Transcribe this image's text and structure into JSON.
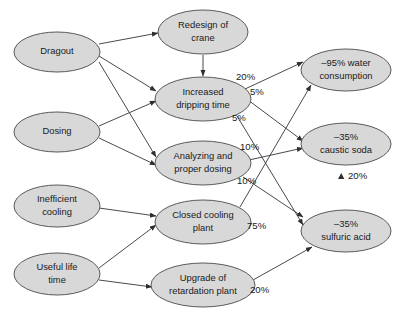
{
  "diagram": {
    "type": "influence-diagram",
    "background_color": "#ffffff",
    "node_fill": "#d8d8d8",
    "node_stroke": "#5a5a5a",
    "edge_color": "#4a4a4a",
    "text_color": "#1a1a1a",
    "nodes": [
      {
        "id": "dragout",
        "label_line1": "Dragout",
        "label_line2": "",
        "cx": 57,
        "cy": 52,
        "rx": 43,
        "ry": 20
      },
      {
        "id": "dosing",
        "label_line1": "Dosing",
        "label_line2": "",
        "cx": 57,
        "cy": 132,
        "rx": 43,
        "ry": 20
      },
      {
        "id": "inefficient",
        "label_line1": "Inefficient",
        "label_line2": "cooling",
        "cx": 57,
        "cy": 206,
        "rx": 43,
        "ry": 21
      },
      {
        "id": "usefullife",
        "label_line1": "Useful life",
        "label_line2": "time",
        "cx": 57,
        "cy": 274,
        "rx": 43,
        "ry": 21
      },
      {
        "id": "redesign",
        "label_line1": "Redesign of",
        "label_line2": "crane",
        "cx": 203,
        "cy": 32,
        "rx": 45,
        "ry": 22
      },
      {
        "id": "dripping",
        "label_line1": "Increased",
        "label_line2": "dripping time",
        "cx": 203,
        "cy": 99,
        "rx": 48,
        "ry": 22
      },
      {
        "id": "analyzing",
        "label_line1": "Analyzing and",
        "label_line2": "proper dosing",
        "cx": 203,
        "cy": 163,
        "rx": 48,
        "ry": 22
      },
      {
        "id": "closedcooling",
        "label_line1": "Closed cooling",
        "label_line2": "plant",
        "cx": 203,
        "cy": 222,
        "rx": 48,
        "ry": 22
      },
      {
        "id": "upgrade",
        "label_line1": "Upgrade of",
        "label_line2": "retardation plant",
        "cx": 203,
        "cy": 285,
        "rx": 52,
        "ry": 22
      },
      {
        "id": "water",
        "label_line1": "–95% water",
        "label_line2": "consumption",
        "cx": 346,
        "cy": 70,
        "rx": 45,
        "ry": 21
      },
      {
        "id": "caustic",
        "label_line1": "–35%",
        "label_line2": "caustic soda",
        "cx": 346,
        "cy": 144,
        "rx": 45,
        "ry": 21
      },
      {
        "id": "sulfuric",
        "label_line1": "–35%",
        "label_line2": "sulfuric acid",
        "cx": 346,
        "cy": 231,
        "rx": 45,
        "ry": 21
      }
    ],
    "edges": [
      {
        "id": "dragout-redesign",
        "from": "dragout",
        "to": "redesign",
        "label": "",
        "x1": 99,
        "y1": 44,
        "x2": 158,
        "y2": 33
      },
      {
        "id": "dragout-dripping",
        "from": "dragout",
        "to": "dripping",
        "label": "",
        "x1": 99,
        "y1": 56,
        "x2": 156,
        "y2": 91
      },
      {
        "id": "dragout-analyzing",
        "from": "dragout",
        "to": "analyzing",
        "label": "",
        "x1": 99,
        "y1": 62,
        "x2": 156,
        "y2": 157
      },
      {
        "id": "redesign-dripping",
        "from": "redesign",
        "to": "dripping",
        "label": "",
        "x1": 203,
        "y1": 55,
        "x2": 203,
        "y2": 76
      },
      {
        "id": "dosing-dripping",
        "from": "dosing",
        "to": "dripping",
        "label": "",
        "x1": 99,
        "y1": 126,
        "x2": 156,
        "y2": 101
      },
      {
        "id": "dosing-analyzing",
        "from": "dosing",
        "to": "analyzing",
        "label": "",
        "x1": 99,
        "y1": 138,
        "x2": 156,
        "y2": 165
      },
      {
        "id": "inefficient-closed",
        "from": "inefficient",
        "to": "closedcooling",
        "label": "",
        "x1": 99,
        "y1": 208,
        "x2": 156,
        "y2": 216
      },
      {
        "id": "usefullife-closed",
        "from": "usefullife",
        "to": "closedcooling",
        "label": "",
        "x1": 99,
        "y1": 268,
        "x2": 156,
        "y2": 225
      },
      {
        "id": "usefullife-upgrade",
        "from": "usefullife",
        "to": "upgrade",
        "label": "",
        "x1": 99,
        "y1": 280,
        "x2": 152,
        "y2": 287
      },
      {
        "id": "dripping-water",
        "from": "dripping",
        "to": "water",
        "label": "20%",
        "x1": 245,
        "y1": 89,
        "x2": 303,
        "y2": 62,
        "lx": 236,
        "ly": 77
      },
      {
        "id": "dripping-caustic",
        "from": "dripping",
        "to": "caustic",
        "label": "5%",
        "x1": 248,
        "y1": 100,
        "x2": 303,
        "y2": 141,
        "lx": 250,
        "ly": 92
      },
      {
        "id": "dripping-sulfuric",
        "from": "dripping",
        "to": "sulfuric",
        "label": "5%",
        "x1": 237,
        "y1": 116,
        "x2": 303,
        "y2": 225,
        "lx": 232,
        "ly": 118
      },
      {
        "id": "analyzing-caustic",
        "from": "analyzing",
        "to": "caustic",
        "label": "10%",
        "x1": 249,
        "y1": 160,
        "x2": 303,
        "y2": 148,
        "lx": 240,
        "ly": 147
      },
      {
        "id": "analyzing-sulfuric",
        "from": "analyzing",
        "to": "sulfuric",
        "label": "10%",
        "x1": 243,
        "y1": 177,
        "x2": 303,
        "y2": 217,
        "lx": 237,
        "ly": 181
      },
      {
        "id": "closedcooling-water",
        "from": "closedcooling",
        "to": "water",
        "label": "75%",
        "x1": 240,
        "y1": 207,
        "x2": 311,
        "y2": 85,
        "lx": 247,
        "ly": 226
      },
      {
        "id": "upgrade-sulfuric",
        "from": "upgrade",
        "to": "sulfuric",
        "label": "20%",
        "x1": 253,
        "y1": 280,
        "x2": 312,
        "y2": 247,
        "lx": 250,
        "ly": 290
      }
    ],
    "annotations": [
      {
        "id": "caustic-sulfuric-note",
        "label": "20%",
        "marker": "up-arrow",
        "x": 348,
        "y": 176,
        "marker_x": 338,
        "marker_y": 174
      }
    ]
  }
}
